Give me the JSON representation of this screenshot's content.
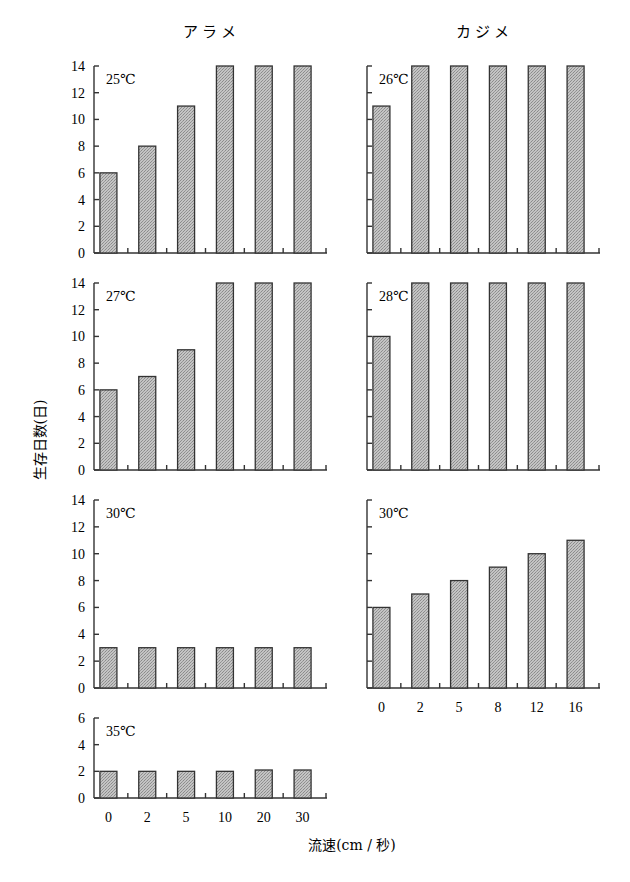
{
  "chart_data": [
    {
      "type": "bar",
      "species": "アラメ",
      "temperature": "25℃",
      "categories": [
        "0",
        "2",
        "5",
        "10",
        "20",
        "30"
      ],
      "values": [
        6,
        8,
        11,
        14,
        14,
        14
      ],
      "ylim": [
        0,
        14
      ],
      "yticks": [
        0,
        2,
        4,
        6,
        8,
        10,
        12,
        14
      ],
      "show_ytick_labels": true,
      "show_xtick_labels": false
    },
    {
      "type": "bar",
      "species": "カジメ",
      "temperature": "26℃",
      "categories": [
        "0",
        "2",
        "5",
        "8",
        "12",
        "16"
      ],
      "values": [
        11,
        14,
        14,
        14,
        14,
        14
      ],
      "ylim": [
        0,
        14
      ],
      "yticks": [
        0,
        2,
        4,
        6,
        8,
        10,
        12,
        14
      ],
      "show_ytick_labels": false,
      "show_xtick_labels": false
    },
    {
      "type": "bar",
      "species": "アラメ",
      "temperature": "27℃",
      "categories": [
        "0",
        "2",
        "5",
        "10",
        "20",
        "30"
      ],
      "values": [
        6,
        7,
        9,
        14,
        14,
        14
      ],
      "ylim": [
        0,
        14
      ],
      "yticks": [
        0,
        2,
        4,
        6,
        8,
        10,
        12,
        14
      ],
      "show_ytick_labels": true,
      "show_xtick_labels": false
    },
    {
      "type": "bar",
      "species": "カジメ",
      "temperature": "28℃",
      "categories": [
        "0",
        "2",
        "5",
        "8",
        "12",
        "16"
      ],
      "values": [
        10,
        14,
        14,
        14,
        14,
        14
      ],
      "ylim": [
        0,
        14
      ],
      "yticks": [
        0,
        2,
        4,
        6,
        8,
        10,
        12,
        14
      ],
      "show_ytick_labels": false,
      "show_xtick_labels": false
    },
    {
      "type": "bar",
      "species": "アラメ",
      "temperature": "30℃",
      "categories": [
        "0",
        "2",
        "5",
        "10",
        "20",
        "30"
      ],
      "values": [
        3,
        3,
        3,
        3,
        3,
        3
      ],
      "ylim": [
        0,
        14
      ],
      "yticks": [
        0,
        2,
        4,
        6,
        8,
        10,
        12,
        14
      ],
      "show_ytick_labels": true,
      "show_xtick_labels": false
    },
    {
      "type": "bar",
      "species": "カジメ",
      "temperature": "30℃",
      "categories": [
        "0",
        "2",
        "5",
        "8",
        "12",
        "16"
      ],
      "values": [
        6,
        7,
        8,
        9,
        10,
        11
      ],
      "ylim": [
        0,
        14
      ],
      "yticks": [
        0,
        2,
        4,
        6,
        8,
        10,
        12,
        14
      ],
      "show_ytick_labels": false,
      "show_xtick_labels": true
    },
    {
      "type": "bar",
      "species": "アラメ",
      "temperature": "35℃",
      "categories": [
        "0",
        "2",
        "5",
        "10",
        "20",
        "30"
      ],
      "values": [
        2,
        2,
        2,
        2,
        2.1,
        2.1
      ],
      "ylim": [
        0,
        6
      ],
      "yticks": [
        0,
        2,
        4,
        6
      ],
      "show_ytick_labels": true,
      "show_xtick_labels": true
    }
  ],
  "titles": {
    "left_column": "アラメ",
    "right_column": "カジメ"
  },
  "axes": {
    "ylabel": "生存日数(日)",
    "xlabel": "流速(cm / 秒)"
  },
  "colors": {
    "bar_fill": "#b4b4b4",
    "bar_stroke": "#333333",
    "axis": "#333333"
  }
}
